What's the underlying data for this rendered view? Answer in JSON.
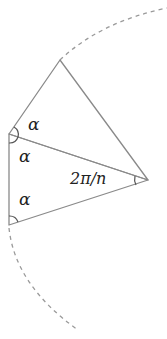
{
  "diagram": {
    "type": "geometry",
    "colors": {
      "line": "#8a8a8a",
      "dash": "#9a9a9a",
      "text": "#222222"
    },
    "points": {
      "center": [
        148,
        180
      ],
      "top": [
        60,
        60
      ],
      "left_upper": [
        9,
        134
      ],
      "left_lower": [
        9,
        225
      ]
    },
    "labels": {
      "alpha_1": "α",
      "alpha_2": "α",
      "alpha_3": "α",
      "central_angle": "2π/n"
    }
  }
}
